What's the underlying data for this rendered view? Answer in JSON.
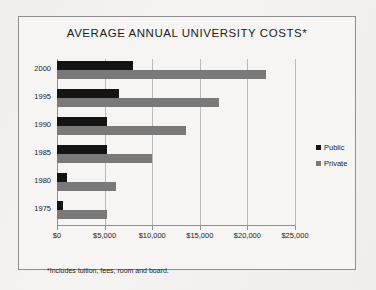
{
  "frame": {
    "border_color": "#8e8e90",
    "background_color": "#f6f5f3"
  },
  "footnote": "*Includes tuition, fees, room and board.",
  "legend": {
    "position": "right",
    "entries": [
      {
        "label": "Public",
        "color": "#141414"
      },
      {
        "label": "Private",
        "color": "#797979"
      }
    ]
  },
  "chart_data": {
    "type": "bar",
    "orientation": "horizontal",
    "title": "AVERAGE ANNUAL UNIVERSITY COSTS*",
    "xlabel": "",
    "ylabel": "",
    "categories": [
      "2000",
      "1995",
      "1990",
      "1985",
      "1980",
      "1975"
    ],
    "series": [
      {
        "name": "Public",
        "color": "#141414",
        "values": [
          8000,
          6500,
          5300,
          5200,
          1000,
          600
        ]
      },
      {
        "name": "Private",
        "color": "#797979",
        "values": [
          22000,
          17000,
          13500,
          10000,
          6200,
          5200
        ]
      }
    ],
    "xlim": [
      0,
      25000
    ],
    "xticks": [
      0,
      5000,
      10000,
      15000,
      20000,
      25000
    ],
    "xticklabels": [
      "$0",
      "$5,000",
      "$10,000",
      "$15,000",
      "$20,000",
      "$25,000"
    ],
    "grid": "vertical",
    "legend_position": "right"
  }
}
